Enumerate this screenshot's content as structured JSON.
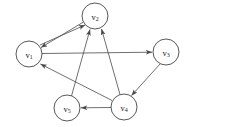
{
  "figure": {
    "type": "directed-graph",
    "width": 226,
    "height": 127,
    "background_color": "#ffffff",
    "node_fill_color": "#ffffff",
    "node_stroke_color": "#3a3a3a",
    "edge_color": "#4a4a4a",
    "label_color": "#1a1a1a"
  },
  "graph": {
    "node_radius": 13,
    "nodes": [
      {
        "id": "v1",
        "letter": "v",
        "subscript": "1",
        "label": "v1",
        "cx": 29,
        "cy": 54
      },
      {
        "id": "v2",
        "letter": "v",
        "subscript": "2",
        "label": "v2",
        "cx": 95,
        "cy": 16
      },
      {
        "id": "v3",
        "letter": "v",
        "subscript": "3",
        "label": "v3",
        "cx": 166,
        "cy": 52
      },
      {
        "id": "v4",
        "letter": "v",
        "subscript": "4",
        "label": "v4",
        "cx": 124,
        "cy": 107
      },
      {
        "id": "v5",
        "letter": "v",
        "subscript": "5",
        "label": "v5",
        "cx": 67,
        "cy": 108
      }
    ],
    "edges": [
      {
        "id": "e-v2-v1",
        "from": "v2",
        "to": "v1",
        "directed": true,
        "arrow_at": "v1"
      },
      {
        "id": "e-v1-v2",
        "from": "v1",
        "to": "v2",
        "directed": true,
        "arrow_at": "v2"
      },
      {
        "id": "e-v1-v3",
        "from": "v1",
        "to": "v3",
        "directed": true,
        "arrow_at": "v3"
      },
      {
        "id": "e-v3-v4",
        "from": "v3",
        "to": "v4",
        "directed": true,
        "arrow_at": "v4"
      },
      {
        "id": "e-v4-v5",
        "from": "v4",
        "to": "v5",
        "directed": true,
        "arrow_at": "v5"
      },
      {
        "id": "e-v4-v1",
        "from": "v4",
        "to": "v1",
        "directed": true,
        "arrow_at": "v1"
      },
      {
        "id": "e-v5-v2",
        "from": "v5",
        "to": "v2",
        "directed": true,
        "arrow_at": "v2"
      },
      {
        "id": "e-v4-v2",
        "from": "v4",
        "to": "v2",
        "directed": true,
        "arrow_at": "v2"
      }
    ]
  }
}
